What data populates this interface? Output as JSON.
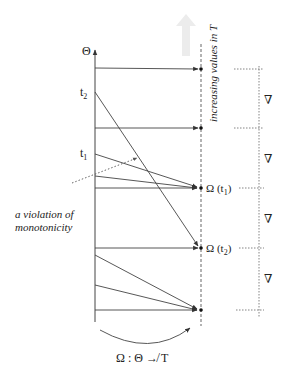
{
  "diagram": {
    "axis_label": "Θ",
    "t_axis_caption": "increasing values in T",
    "points": {
      "t1": {
        "label": "t",
        "sub": "1"
      },
      "t2": {
        "label": "t",
        "sub": "2"
      }
    },
    "images": {
      "omega_t1": {
        "prefix": "Ω (t",
        "sub": "1",
        "suffix": ")"
      },
      "omega_t2": {
        "prefix": "Ω (t",
        "sub": "2",
        "suffix": ")"
      }
    },
    "annotation": {
      "line1": "a violation of",
      "line2": "monotonicity"
    },
    "interval_labels": [
      "∇",
      "∇",
      "∇",
      "∇"
    ],
    "mapping_caption": "Ω : Θ ↛ T"
  }
}
